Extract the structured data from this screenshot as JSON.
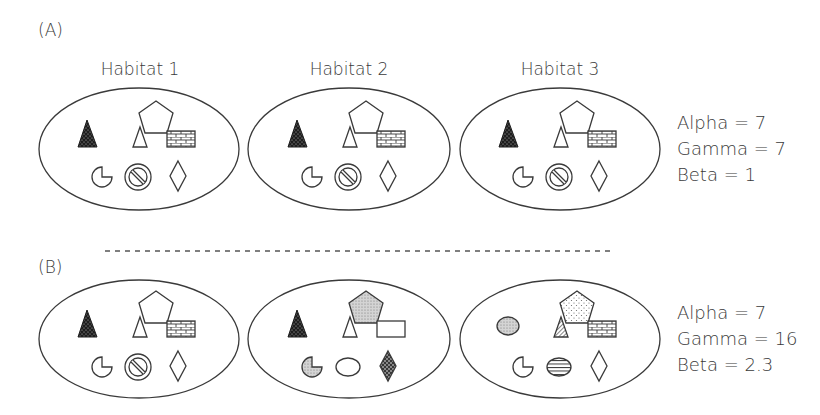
{
  "panels": [
    {
      "label": "(A)",
      "habitat_titles": [
        "Habitat 1",
        "Habitat 2",
        "Habitat 3"
      ],
      "stats": [
        "Alpha = 7",
        "Gamma = 7",
        "Beta = 1"
      ],
      "habitats": [
        [
          "dark-dotted-triangle",
          "open-pentagon",
          "open-triangle",
          "brick-rectangle",
          "open-pacman",
          "circle-slash",
          "open-diamond"
        ],
        [
          "dark-dotted-triangle",
          "open-pentagon",
          "open-triangle",
          "brick-rectangle",
          "open-pacman",
          "circle-slash",
          "open-diamond"
        ],
        [
          "dark-dotted-triangle",
          "open-pentagon",
          "open-triangle",
          "brick-rectangle",
          "open-pacman",
          "circle-slash",
          "open-diamond"
        ]
      ]
    },
    {
      "label": "(B)",
      "stats": [
        "Alpha = 7",
        "Gamma = 16",
        "Beta = 2.3"
      ],
      "habitats": [
        [
          "dark-dotted-triangle",
          "open-pentagon",
          "open-triangle",
          "brick-rectangle",
          "open-pacman",
          "circle-slash",
          "open-diamond"
        ],
        [
          "dark-dotted-triangle",
          "grey-dotted-pentagon",
          "open-triangle",
          "open-rectangle",
          "grey-dotted-pacman",
          "open-ellipse",
          "crosshatched-diamond"
        ],
        [
          "grey-dotted-ellipse",
          "light-dotted-pentagon",
          "hatched-triangle",
          "brick-rectangle",
          "open-pacman",
          "striped-ellipse",
          "open-diamond"
        ]
      ]
    }
  ],
  "colors": {
    "stroke": "#3a3a3a",
    "background": "#ffffff",
    "grey_fill": "#c8c8c8",
    "dark_fill": "#1e1e1e"
  }
}
